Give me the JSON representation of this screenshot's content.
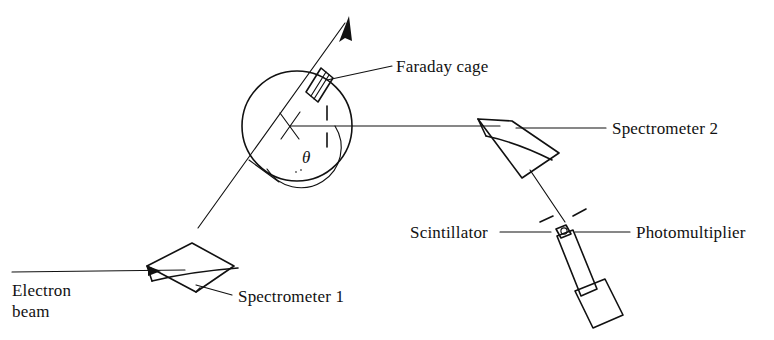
{
  "figure": {
    "kind": "schematic-diagram",
    "background_color": "#ffffff",
    "ink_color": "#111111"
  },
  "labels": {
    "faraday_cage": "Faraday cage",
    "spectrometer_2": "Spectrometer 2",
    "spectrometer_1": "Spectrometer 1",
    "scintillator": "Scintillator",
    "photomultiplier": "Photomultiplier",
    "electron_beam_line1": "Electron",
    "electron_beam_line2": "beam",
    "scattering_angle": "θ"
  },
  "components": {
    "scattering_chamber": {
      "name": "scattering-chamber",
      "shape": "circle",
      "center_x": 297,
      "center_y": 126,
      "radius": 55
    },
    "target_marker": {
      "name": "target-cross",
      "x": 290,
      "y": 125
    },
    "faraday_cage_body": {
      "name": "faraday-cage",
      "shape": "slanted-rectangle"
    },
    "undeflected_beam_arrow": {
      "name": "undeflected-beam-arrow",
      "tip_x": 348,
      "tip_y": 18
    },
    "spectrometer_1_magnet": {
      "name": "spectrometer-1-magnet",
      "shape": "curved-wedge"
    },
    "spectrometer_2_magnet": {
      "name": "spectrometer-2-magnet",
      "shape": "curved-wedge"
    },
    "photomultiplier_tube": {
      "name": "photomultiplier-tube",
      "shape": "tube-with-base"
    },
    "scintillator_crystal": {
      "name": "scintillator-crystal",
      "shape": "small-block"
    }
  }
}
